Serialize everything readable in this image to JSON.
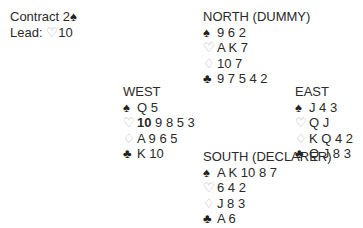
{
  "contract": {
    "label": "Contract",
    "value": "2",
    "suit_symbol": "♠"
  },
  "lead": {
    "label": "Lead:",
    "suit_symbol": "♡",
    "card": "10"
  },
  "hands": {
    "north": {
      "title": "NORTH (DUMMY)",
      "spades": "9 6 2",
      "hearts": "A K 7",
      "diamonds": "10 7",
      "clubs": "9 7 5 4 2"
    },
    "west": {
      "title": "WEST",
      "spades": "Q 5",
      "hearts_lead": "10",
      "hearts_rest": "9 8 5 3",
      "diamonds": "A 9 6 5",
      "clubs": "K 10"
    },
    "east": {
      "title": "EAST",
      "spades": "J 4 3",
      "hearts": "Q J",
      "diamonds": "K Q 4 2",
      "clubs": "Q J 8 3"
    },
    "south": {
      "title": "SOUTH (DECLARER)",
      "spades": "A K 10 8 7",
      "hearts": "6 4 2",
      "diamonds": "J 8 3",
      "clubs": "A 6"
    }
  },
  "symbols": {
    "spade": "♠",
    "heart": "♡",
    "diamond": "♢",
    "club": "♣"
  }
}
